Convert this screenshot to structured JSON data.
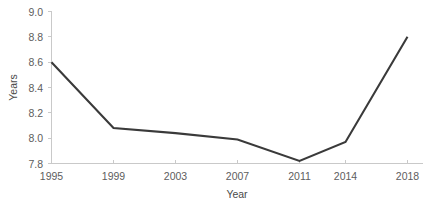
{
  "chart_data": {
    "type": "line",
    "title": "",
    "xlabel": "Year",
    "ylabel": "Years",
    "categories": [
      "1995",
      "1999",
      "2003",
      "2007",
      "2011",
      "2014",
      "2018"
    ],
    "x": [
      1995,
      1999,
      2003,
      2007,
      2011,
      2014,
      2018
    ],
    "values": [
      8.6,
      8.08,
      8.04,
      7.99,
      7.82,
      7.97,
      8.8
    ],
    "series": [
      {
        "name": "Years",
        "values": [
          8.6,
          8.08,
          8.04,
          7.99,
          7.82,
          7.97,
          8.8
        ]
      }
    ],
    "ylim": [
      7.8,
      9.0
    ],
    "ytick_labels": [
      "9.0",
      "8.8",
      "8.6",
      "8.4",
      "8.2",
      "8.0",
      "7.8"
    ],
    "ytick_values": [
      9.0,
      8.8,
      8.6,
      8.4,
      8.2,
      8.0,
      7.8
    ],
    "xtick_labels": [
      "1995",
      "1999",
      "2003",
      "2007",
      "2011",
      "2014",
      "2018"
    ],
    "grid": false,
    "legend": "none",
    "line_color": "#3a3a3a",
    "axis_color": "#c9c9c9",
    "label_color": "#5d5d5d",
    "background": "#ffffff"
  },
  "axis": {
    "y_title": "Years",
    "x_title": "Year"
  }
}
